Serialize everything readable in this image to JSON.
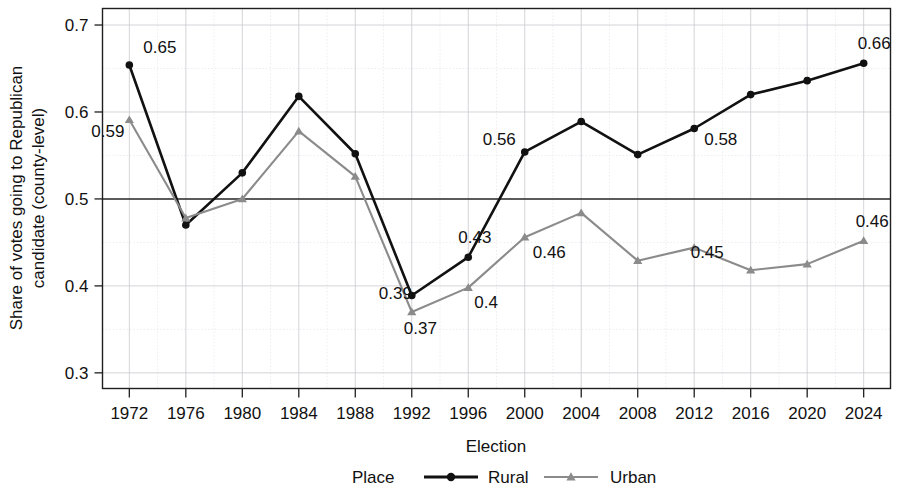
{
  "chart_data": {
    "type": "line",
    "title": "",
    "xlabel": "Election",
    "ylabel": "Share of votes going to Republican candidate (county-level)",
    "x": [
      1972,
      1976,
      1980,
      1984,
      1988,
      1992,
      1996,
      2000,
      2004,
      2008,
      2012,
      2016,
      2020,
      2024
    ],
    "xticklabels": [
      "1972",
      "1976",
      "1980",
      "1984",
      "1988",
      "1992",
      "1996",
      "2000",
      "2004",
      "2008",
      "2012",
      "2016",
      "2020",
      "2024"
    ],
    "yticklabels": [
      "0.3",
      "0.4",
      "0.5",
      "0.6",
      "0.7"
    ],
    "yticks": [
      0.3,
      0.4,
      0.5,
      0.6,
      0.7
    ],
    "ylim": [
      0.282,
      0.719
    ],
    "xlim": [
      1970.1,
      2025.9
    ],
    "grid": true,
    "reference_line": 0.5,
    "legend_position": "bottom",
    "legend_title": "Place",
    "series": [
      {
        "name": "Rural",
        "color": "#111111",
        "marker": "circle",
        "values": [
          0.654,
          0.47,
          0.53,
          0.618,
          0.552,
          0.389,
          0.433,
          0.554,
          0.589,
          0.551,
          0.581,
          0.62,
          0.636,
          0.656
        ],
        "point_labels": [
          {
            "x": 1972,
            "y": 0.654,
            "text": "0.65",
            "dx": 14,
            "dy": -12
          },
          {
            "x": 1992,
            "y": 0.389,
            "text": "0.39",
            "dx": -33,
            "dy": 4
          },
          {
            "x": 1996,
            "y": 0.433,
            "text": "0.43",
            "dx": -10,
            "dy": -14
          },
          {
            "x": 2000,
            "y": 0.554,
            "text": "0.56",
            "dx": -42,
            "dy": -7
          },
          {
            "x": 2012,
            "y": 0.581,
            "text": "0.58",
            "dx": 10,
            "dy": 16
          },
          {
            "x": 2024,
            "y": 0.656,
            "text": "0.66",
            "dx": -6,
            "dy": -14
          }
        ]
      },
      {
        "name": "Urban",
        "color": "#8b8b8b",
        "marker": "triangle",
        "values": [
          0.591,
          0.478,
          0.5,
          0.578,
          0.526,
          0.37,
          0.398,
          0.456,
          0.484,
          0.429,
          0.444,
          0.418,
          0.425,
          0.452
        ],
        "point_labels": [
          {
            "x": 1972,
            "y": 0.591,
            "text": "0.59",
            "dx": -38,
            "dy": 17
          },
          {
            "x": 1992,
            "y": 0.37,
            "text": "0.37",
            "dx": -8,
            "dy": 22
          },
          {
            "x": 1996,
            "y": 0.398,
            "text": "0.4",
            "dx": 6,
            "dy": 20
          },
          {
            "x": 2000,
            "y": 0.456,
            "text": "0.46",
            "dx": 8,
            "dy": 21
          },
          {
            "x": 2016,
            "y": 0.418,
            "text": "0.45",
            "dx": -60,
            "dy": -12
          },
          {
            "x": 2024,
            "y": 0.452,
            "text": "0.46",
            "dx": -8,
            "dy": -14
          }
        ]
      }
    ]
  },
  "legend": {
    "title": "Place",
    "items": [
      {
        "label": "Rural",
        "color": "#111111",
        "marker": "circle"
      },
      {
        "label": "Urban",
        "color": "#8b8b8b",
        "marker": "triangle"
      }
    ]
  }
}
